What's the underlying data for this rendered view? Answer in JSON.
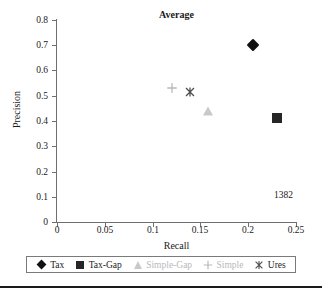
{
  "chart_data": {
    "type": "scatter",
    "title": "Average",
    "xlabel": "Recall",
    "ylabel": "Precision",
    "xlim": [
      0,
      0.25
    ],
    "ylim": [
      0,
      0.8
    ],
    "grid": false,
    "legend_position": "bottom",
    "xticks": [
      "0",
      "0.05",
      "0.1",
      "0.15",
      "0.2",
      "0.25"
    ],
    "xtick_values": [
      0,
      0.05,
      0.1,
      0.15,
      0.2,
      0.25
    ],
    "yticks": [
      "0",
      "0.1",
      "0.2",
      "0.3",
      "0.4",
      "0.5",
      "0.6",
      "0.7",
      "0.8"
    ],
    "ytick_values": [
      0,
      0.1,
      0.2,
      0.3,
      0.4,
      0.5,
      0.6,
      0.7,
      0.8
    ],
    "annotations": [
      {
        "text": "1382",
        "x": 0.225,
        "y": 0.125
      }
    ],
    "series": [
      {
        "name": "Tax",
        "marker": "diamond",
        "color": "#111111",
        "x": 0.205,
        "y": 0.7
      },
      {
        "name": "Tax-Gap",
        "marker": "square",
        "color": "#262626",
        "x": 0.23,
        "y": 0.41
      },
      {
        "name": "Simple-Gap",
        "marker": "triangle",
        "color": "#c9c9c9",
        "x": 0.158,
        "y": 0.44
      },
      {
        "name": "Simple",
        "marker": "plus",
        "color": "#b9b9b9",
        "x": 0.12,
        "y": 0.53
      },
      {
        "name": "Ures",
        "marker": "ex-star",
        "color": "#4d4d4d",
        "x": 0.139,
        "y": 0.515
      }
    ]
  },
  "legend": {
    "items": [
      {
        "label": "Tax"
      },
      {
        "label": "Tax-Gap"
      },
      {
        "label": "Simple-Gap"
      },
      {
        "label": "Simple"
      },
      {
        "label": "Ures"
      }
    ]
  }
}
